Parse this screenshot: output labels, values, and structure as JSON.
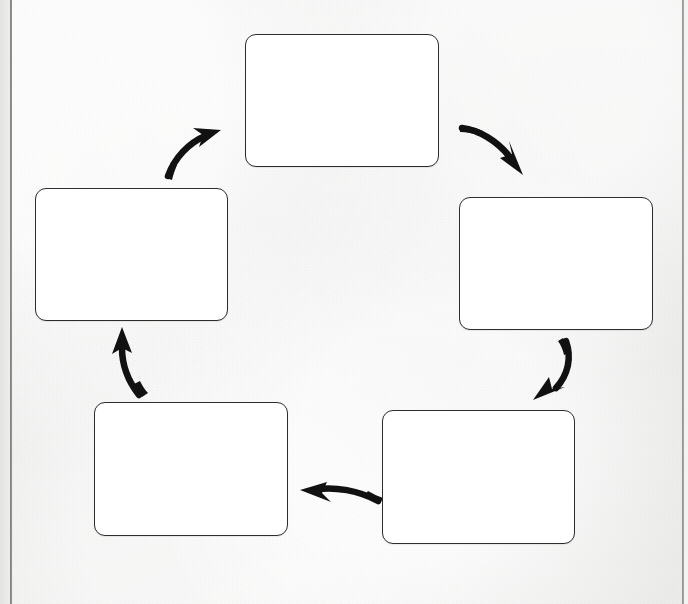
{
  "document": {
    "kind": "cycle-diagram",
    "medium": "scanned-paper",
    "background_color": "#eeeeed",
    "ink_color": "#2d2d2d",
    "box_fill_color": "#ffffff",
    "arrow_color": "#111111",
    "node_count": 5,
    "arrow_count": 5,
    "flow_direction": "clockwise",
    "page_edges": {
      "left_spine_label": "left page edge",
      "right_trim_label": "right page edge"
    }
  },
  "nodes": [
    {
      "id": "node-1",
      "name": "top-node",
      "label": "",
      "x": 245,
      "y": 34,
      "w": 194,
      "h": 133
    },
    {
      "id": "node-2",
      "name": "upper-right-node",
      "label": "",
      "x": 459,
      "y": 197,
      "w": 194,
      "h": 133
    },
    {
      "id": "node-3",
      "name": "lower-right-node",
      "label": "",
      "x": 382,
      "y": 410,
      "w": 193,
      "h": 134
    },
    {
      "id": "node-4",
      "name": "lower-left-node",
      "label": "",
      "x": 94,
      "y": 402,
      "w": 194,
      "h": 134
    },
    {
      "id": "node-5",
      "name": "upper-left-node",
      "label": "",
      "x": 35,
      "y": 188,
      "w": 193,
      "h": 133
    }
  ],
  "arrows": [
    {
      "id": "arrow-1",
      "name": "arrow-top-to-upper-right",
      "from": "node-1",
      "to": "node-2",
      "label": "",
      "direction": "down-right"
    },
    {
      "id": "arrow-2",
      "name": "arrow-upper-right-to-lower-right",
      "from": "node-2",
      "to": "node-3",
      "label": "",
      "direction": "down-left"
    },
    {
      "id": "arrow-3",
      "name": "arrow-lower-right-to-lower-left",
      "from": "node-3",
      "to": "node-4",
      "label": "",
      "direction": "left"
    },
    {
      "id": "arrow-4",
      "name": "arrow-lower-left-to-upper-left",
      "from": "node-4",
      "to": "node-5",
      "label": "",
      "direction": "up"
    },
    {
      "id": "arrow-5",
      "name": "arrow-upper-left-to-top",
      "from": "node-5",
      "to": "node-1",
      "label": "",
      "direction": "up-right"
    }
  ]
}
